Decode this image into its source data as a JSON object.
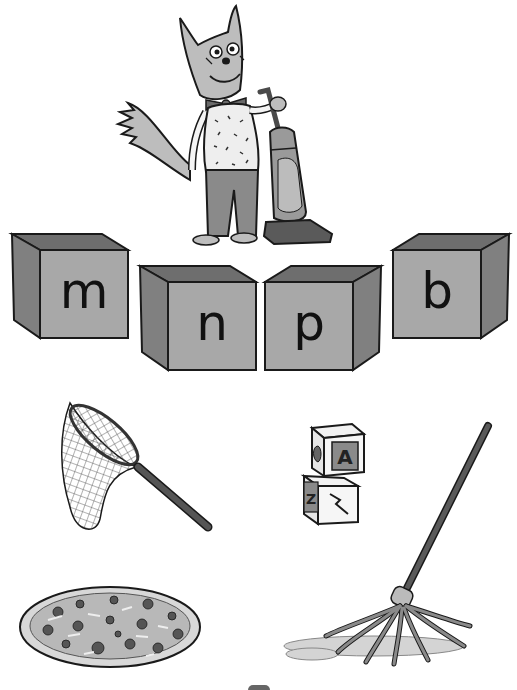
{
  "scene": {
    "title": "Phonics sorting activity",
    "background": "#ffffff",
    "character": {
      "name": "fox-character",
      "holding": "vacuum-cleaner",
      "accessories": [
        "glasses",
        "bow-tie",
        "speckled-vest"
      ]
    }
  },
  "colors": {
    "outline": "#1a1a1a",
    "box_front": "#a8a8a8",
    "box_side": "#808080",
    "box_inner": "#6e6e6e",
    "fur": "#bdbdbd",
    "pants": "#8a8a8a",
    "vacuum_body": "#9a9a9a",
    "vacuum_base": "#5a5a5a",
    "handle": "#555555"
  },
  "boxes": [
    {
      "letter": "m",
      "side": "left"
    },
    {
      "letter": "n",
      "side": "left"
    },
    {
      "letter": "p",
      "side": "right"
    },
    {
      "letter": "b",
      "side": "right"
    }
  ],
  "pictures": [
    {
      "label": "net",
      "icon": "butterfly-net-icon"
    },
    {
      "label": "blocks",
      "icon": "toy-blocks-icon",
      "block_letters": [
        "A",
        "Z"
      ]
    },
    {
      "label": "pizza",
      "icon": "pizza-icon"
    },
    {
      "label": "mop",
      "icon": "mop-icon"
    }
  ]
}
